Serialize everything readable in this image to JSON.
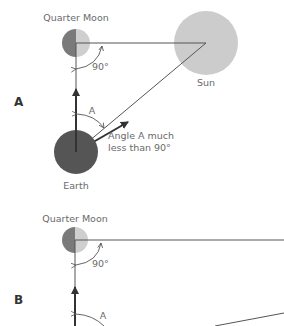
{
  "panel_a": {
    "label": "A",
    "moon_label": "Quarter Moon",
    "right_angle_label": "90°",
    "sun_label": "Sun",
    "angle_label": "A",
    "note_line1": "Angle A much",
    "note_line2": "less than 90°",
    "earth_label": "Earth"
  },
  "panel_b": {
    "label": "B",
    "moon_label": "Quarter Moon",
    "right_angle_label": "90°",
    "angle_label": "A"
  },
  "colors": {
    "earth": "#555555",
    "moon_dark": "#7a7a7a",
    "moon_light": "#cfcfcf",
    "sun": "#cccccc",
    "line": "#555555"
  }
}
